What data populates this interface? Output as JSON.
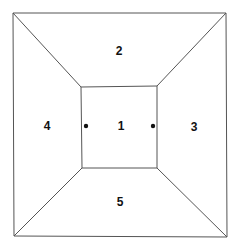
{
  "diagram": {
    "line_color": "#555555",
    "label_color": "#111111",
    "dot_color": "#111111",
    "outer_square": {
      "tl": [
        13,
        13
      ],
      "tr": [
        226,
        13
      ],
      "br": [
        227,
        237
      ],
      "bl": [
        14,
        236
      ]
    },
    "inner_square": {
      "tl": [
        81,
        87
      ],
      "tr": [
        157,
        86
      ],
      "br": [
        157,
        168
      ],
      "bl": [
        82,
        168
      ]
    },
    "regions": [
      {
        "id": "1",
        "label": "1",
        "name": "center",
        "pos": [
          121,
          126
        ]
      },
      {
        "id": "2",
        "label": "2",
        "name": "top",
        "pos": [
          119,
          51
        ]
      },
      {
        "id": "3",
        "label": "3",
        "name": "right",
        "pos": [
          194,
          127
        ]
      },
      {
        "id": "4",
        "label": "4",
        "name": "left",
        "pos": [
          47,
          126
        ]
      },
      {
        "id": "5",
        "label": "5",
        "name": "bottom",
        "pos": [
          120,
          202
        ]
      }
    ],
    "dots": [
      {
        "name": "left-dot",
        "pos": [
          86,
          126
        ]
      },
      {
        "name": "right-dot",
        "pos": [
          153,
          126
        ]
      }
    ]
  }
}
